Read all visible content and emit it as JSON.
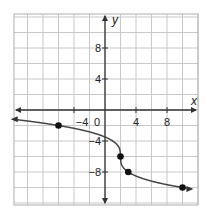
{
  "chart_data": {
    "type": "line",
    "title": "",
    "xlabel": "x",
    "ylabel": "y",
    "xlim": [
      -12,
      12
    ],
    "ylim": [
      -12,
      12
    ],
    "grid": true,
    "grid_step": 2,
    "x_ticks": [
      {
        "value": -4,
        "label": "−4"
      },
      {
        "value": 4,
        "label": "4"
      },
      {
        "value": 8,
        "label": "8"
      }
    ],
    "y_ticks": [
      {
        "value": 8,
        "label": "8"
      },
      {
        "value": 4,
        "label": "4"
      },
      {
        "value": -4,
        "label": "−4"
      },
      {
        "value": -8,
        "label": "−8"
      }
    ],
    "origin_label": "0",
    "function": "y = -2*cbrt(x - 2) - 6",
    "points": [
      {
        "x": -6,
        "y": -2
      },
      {
        "x": 2,
        "y": -6
      },
      {
        "x": 3,
        "y": -8
      },
      {
        "x": 10,
        "y": -10
      }
    ],
    "curve_arrows": "both"
  },
  "colors": {
    "grid": "#c8c8c8",
    "axis": "#333333",
    "curve": "#444444",
    "point": "#111111",
    "border": "#bbbbbb"
  }
}
